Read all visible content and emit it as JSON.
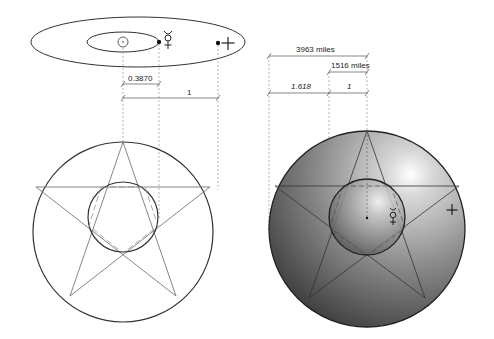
{
  "orbit_diagram": {
    "sun_symbol": "sun-icon",
    "mercury_symbol": "☿",
    "earth_symbol": "♁",
    "mercury_distance_label": "0.3870",
    "earth_distance_label": "1"
  },
  "size_diagram": {
    "earth_radius_label": "3963 miles",
    "mercury_radius_label": "1516 miles",
    "ratio_large_label": "1.618",
    "ratio_small_label": "1",
    "mercury_symbol": "☿",
    "earth_symbol": "♁"
  },
  "colors": {
    "line": "#333333",
    "guide": "#888888",
    "sphere_light": "#f2f2f2",
    "sphere_dark": "#3a3a3a"
  }
}
